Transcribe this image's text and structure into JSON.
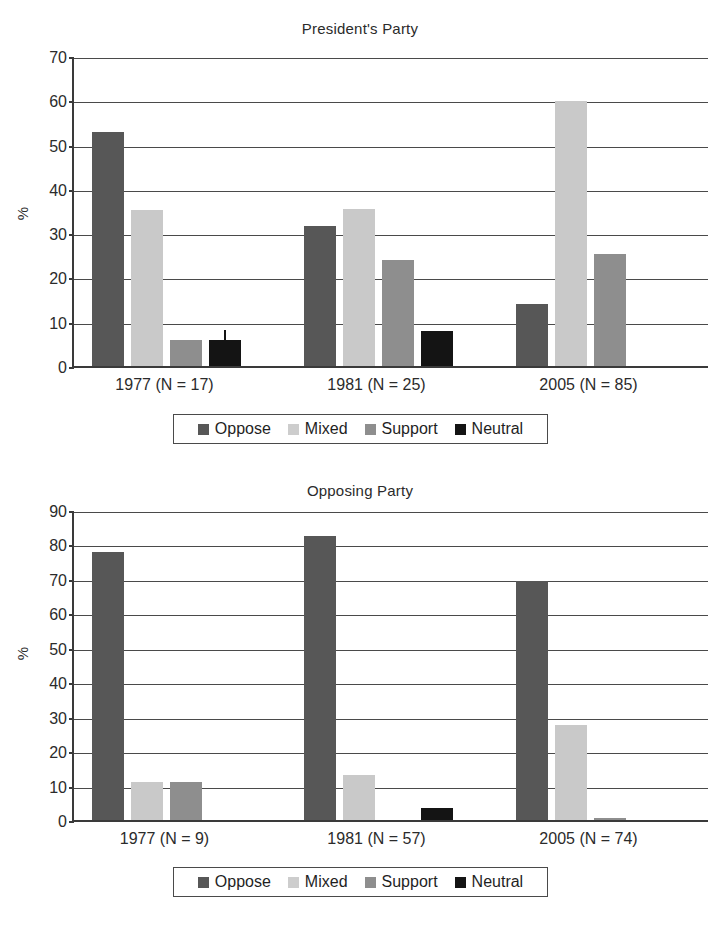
{
  "chart_data": [
    {
      "type": "bar",
      "title": "President's Party",
      "xlabel": "",
      "ylabel": "%",
      "ylim": [
        0,
        70
      ],
      "ytick_step": 10,
      "yticks": [
        0,
        10,
        20,
        30,
        40,
        50,
        60,
        70
      ],
      "grid": true,
      "legend_position": "bottom",
      "categories": [
        "1977 (N = 17)",
        "1981 (N = 25)",
        "2005 (N = 85)"
      ],
      "series": [
        {
          "name": "Oppose",
          "color": "#575757",
          "values": [
            52.9,
            31.7,
            13.9
          ]
        },
        {
          "name": "Mixed",
          "color": "#c9c9c9",
          "values": [
            35.3,
            35.5,
            59.8
          ]
        },
        {
          "name": "Support",
          "color": "#8e8e8e",
          "values": [
            5.9,
            24.0,
            25.2
          ]
        },
        {
          "name": "Neutral",
          "color": "#141414",
          "values": [
            5.9,
            8.0,
            0
          ]
        }
      ],
      "annotations": [
        {
          "note": "error-bar tick atop 1977 Neutral bar",
          "group": 0,
          "series": 3,
          "top": 8.5
        }
      ]
    },
    {
      "type": "bar",
      "title": "Opposing Party",
      "xlabel": "",
      "ylabel": "%",
      "ylim": [
        0,
        90
      ],
      "ytick_step": 10,
      "yticks": [
        0,
        10,
        20,
        30,
        40,
        50,
        60,
        70,
        80,
        90
      ],
      "grid": true,
      "legend_position": "bottom",
      "categories": [
        "1977 (N = 9)",
        "1981 (N = 57)",
        "2005 (N = 74)"
      ],
      "series": [
        {
          "name": "Oppose",
          "color": "#575757",
          "values": [
            77.8,
            82.5,
            69.5
          ]
        },
        {
          "name": "Mixed",
          "color": "#c9c9c9",
          "values": [
            11.1,
            13.2,
            27.5
          ]
        },
        {
          "name": "Support",
          "color": "#8e8e8e",
          "values": [
            11.1,
            0,
            0.7
          ]
        },
        {
          "name": "Neutral",
          "color": "#141414",
          "values": [
            0,
            3.5,
            0
          ]
        }
      ],
      "annotations": []
    }
  ],
  "charts": [
    {
      "title": "President's Party",
      "ylabel": "%",
      "yticks": [
        "70",
        "60",
        "50",
        "40",
        "30",
        "20",
        "10",
        "0"
      ],
      "xticks": [
        "1977 (N = 17)",
        "1981 (N = 25)",
        "2005 (N = 85)"
      ],
      "legend": [
        "Oppose",
        "Mixed",
        "Support",
        "Neutral"
      ]
    },
    {
      "title": "Opposing Party",
      "ylabel": "%",
      "yticks": [
        "90",
        "80",
        "70",
        "60",
        "50",
        "40",
        "30",
        "20",
        "10",
        "0"
      ],
      "xticks": [
        "1977 (N = 9)",
        "1981 (N = 57)",
        "2005 (N = 74)"
      ],
      "legend": [
        "Oppose",
        "Mixed",
        "Support",
        "Neutral"
      ]
    }
  ]
}
